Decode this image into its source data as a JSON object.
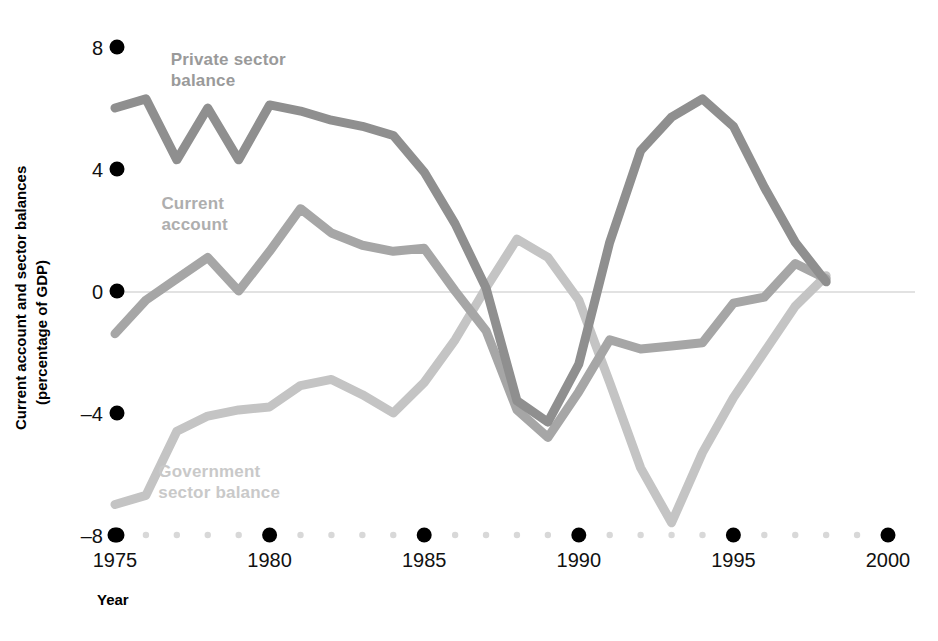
{
  "chart_data": {
    "type": "line",
    "title": "",
    "xlabel": "Year",
    "ylabel": "Current account and sector balances (percentage of GDP)",
    "xlim": [
      1975,
      2000
    ],
    "ylim": [
      -8,
      8
    ],
    "x_ticks": [
      "1975",
      "1980",
      "1985",
      "1990",
      "1995",
      "2000"
    ],
    "x_tick_values": [
      1975,
      1980,
      1985,
      1990,
      1995,
      2000
    ],
    "y_ticks": [
      "8",
      "4",
      "0",
      "–4",
      "–8"
    ],
    "y_tick_values": [
      8,
      4,
      0,
      -4,
      -8
    ],
    "grid": false,
    "legend_position": "inline-annotations",
    "zero_line": true,
    "minor_x_ticks": [
      1976,
      1977,
      1978,
      1979,
      1981,
      1982,
      1983,
      1984,
      1986,
      1987,
      1988,
      1989,
      1991,
      1992,
      1993,
      1994,
      1996,
      1997,
      1998,
      1999
    ],
    "x": [
      1975,
      1976,
      1977,
      1978,
      1979,
      1980,
      1981,
      1982,
      1983,
      1984,
      1985,
      1986,
      1987,
      1988,
      1989,
      1990,
      1991,
      1992,
      1993,
      1994,
      1995,
      1996,
      1997,
      1998
    ],
    "series": [
      {
        "name": "Private sector balance",
        "color": "#8f8f8f",
        "label_color": "#9a9a9a",
        "label_lines": [
          "Private sector",
          "balance"
        ],
        "label_x": 1976.8,
        "label_y": 7.4,
        "values": [
          6.0,
          6.3,
          4.3,
          6.0,
          4.3,
          6.1,
          5.9,
          5.6,
          5.4,
          5.1,
          3.9,
          2.2,
          0.1,
          -3.6,
          -4.3,
          -2.4,
          1.6,
          4.6,
          5.7,
          6.3,
          5.4,
          3.4,
          1.6,
          0.3
        ]
      },
      {
        "name": "Current account",
        "color": "#a6a6a6",
        "label_color": "#aeaeae",
        "label_lines": [
          "Current",
          "account"
        ],
        "label_x": 1976.5,
        "label_y": 2.7,
        "values": [
          -1.4,
          -0.3,
          0.4,
          1.1,
          0.0,
          1.3,
          2.7,
          1.9,
          1.5,
          1.3,
          1.4,
          0.0,
          -1.3,
          -3.9,
          -4.8,
          -3.3,
          -1.6,
          -1.9,
          -1.8,
          -1.7,
          -0.4,
          -0.2,
          0.9,
          0.4
        ]
      },
      {
        "name": "Government sector balance",
        "color": "#c4c4c4",
        "label_color": "#c9c9c9",
        "label_lines": [
          "Government",
          "sector balance"
        ],
        "label_x": 1976.4,
        "label_y": -6.1,
        "values": [
          -7.0,
          -6.7,
          -4.6,
          -4.1,
          -3.9,
          -3.8,
          -3.1,
          -2.9,
          -3.4,
          -4.0,
          -3.0,
          -1.6,
          0.1,
          1.7,
          1.1,
          -0.3,
          -3.0,
          -5.8,
          -7.6,
          -5.3,
          -3.5,
          -2.0,
          -0.5,
          0.5
        ]
      }
    ]
  },
  "axis": {
    "x_title": "Year",
    "y_title_line1": "Current account and sector balances",
    "y_title_line2": "(percentage of GDP)"
  },
  "style": {
    "background": "#ffffff",
    "tick_dot_major": "#000000",
    "tick_dot_minor": "#d8d8d8",
    "zero_line_color": "#e2e2e2",
    "line_width": 9
  }
}
